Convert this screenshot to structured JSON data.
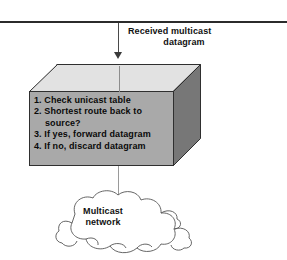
{
  "figure": {
    "type": "network-diagram",
    "top_remnants": {
      "fragment_left": "·",
      "fragment_right": "··"
    },
    "divider": {
      "name": "horizontal-rule",
      "color": "#2b2b2b"
    },
    "incoming_arrow": {
      "direction": "down",
      "label_line1": "Received multicast",
      "label_line2": "datagram",
      "color": "#3a3a3a"
    },
    "process_box": {
      "shape": "3d-box",
      "top_face_color": "#e2e2e2",
      "front_face_color": "#a9a9a9",
      "side_face_color": "#777777",
      "outline_color": "#2f2f2f",
      "steps": [
        {
          "text": "1. Check unicast table",
          "indented": false
        },
        {
          "text": "2. Shortest route back to",
          "indented": false
        },
        {
          "text": "source?",
          "indented": true
        },
        {
          "text": "3.  If yes, forward datagram",
          "indented": false
        },
        {
          "text": "4. If no, discard datagram",
          "indented": false
        }
      ]
    },
    "connector": {
      "name": "box-to-cloud-link",
      "color": "#9a9a9a"
    },
    "cloud": {
      "label_line1": "Multicast",
      "label_line2": "network",
      "outline_color": "#555555",
      "fill_color": "#ffffff"
    }
  }
}
